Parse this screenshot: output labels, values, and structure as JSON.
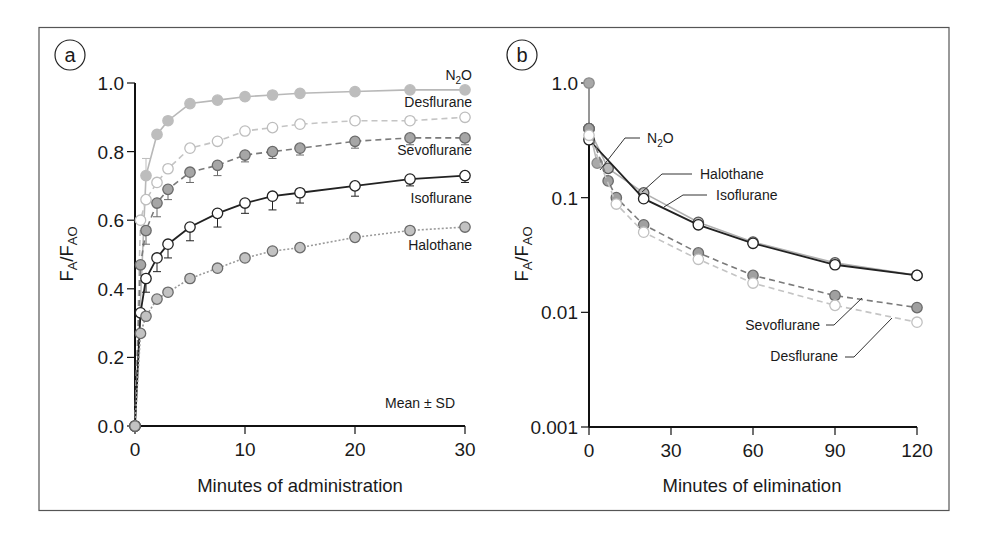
{
  "chart_data": [
    {
      "panel": "a",
      "type": "line",
      "title": "",
      "xlabel": "Minutes of administration",
      "ylabel": "FA/FAO",
      "ylabel_main": "F",
      "ylabel_sub1": "A",
      "ylabel_sub2": "AO",
      "xlim": [
        0,
        30
      ],
      "ylim": [
        0,
        1.0
      ],
      "yscale": "linear",
      "xticks": [
        0,
        10,
        20,
        30
      ],
      "xtick_labels": [
        "0",
        "10",
        "20",
        "30"
      ],
      "yticks": [
        0,
        0.2,
        0.4,
        0.6,
        0.8,
        1.0
      ],
      "ytick_labels": [
        "0.0",
        "0.2",
        "0.4",
        "0.6",
        "0.8",
        "1.0"
      ],
      "grid": false,
      "annotation": "Mean ± SD",
      "series": [
        {
          "name": "N2O",
          "label_main": "N",
          "label_sub": "2",
          "label_tail": "O",
          "style": "solid",
          "line_color": "#b8b8b8",
          "marker": "filled",
          "marker_fill": "#bdbdbd",
          "marker_stroke": "#bdbdbd",
          "x": [
            0,
            1,
            2,
            3,
            5,
            7.5,
            10,
            12.5,
            15,
            20,
            25,
            30
          ],
          "y": [
            0,
            0.73,
            0.85,
            0.89,
            0.94,
            0.95,
            0.96,
            0.965,
            0.97,
            0.975,
            0.98,
            0.98
          ],
          "sd": [
            0,
            0.05,
            0,
            0,
            0,
            0,
            0,
            0,
            0,
            0,
            0,
            0
          ]
        },
        {
          "name": "Desflurane",
          "style": "dashed",
          "line_color": "#c4c4c4",
          "marker": "open",
          "marker_fill": "#ffffff",
          "marker_stroke": "#bdbdbd",
          "x": [
            0,
            0.5,
            1,
            2,
            3,
            5,
            7.5,
            10,
            12.5,
            15,
            20,
            25,
            30
          ],
          "y": [
            0,
            0.6,
            0.66,
            0.71,
            0.75,
            0.81,
            0.83,
            0.86,
            0.87,
            0.88,
            0.89,
            0.89,
            0.9
          ],
          "sd": [
            0,
            0,
            0,
            0,
            0,
            0,
            0,
            0,
            0,
            0,
            0,
            0,
            0
          ]
        },
        {
          "name": "Sevoflurane",
          "style": "dashed",
          "line_color": "#7a7a7a",
          "marker": "filled",
          "marker_fill": "#a6a6a6",
          "marker_stroke": "#6a6a6a",
          "x": [
            0,
            0.5,
            1,
            2,
            3,
            5,
            7.5,
            10,
            12.5,
            15,
            20,
            25,
            30
          ],
          "y": [
            0,
            0.47,
            0.57,
            0.65,
            0.69,
            0.74,
            0.76,
            0.79,
            0.8,
            0.81,
            0.83,
            0.84,
            0.84
          ],
          "sd": [
            0,
            0,
            0.04,
            0.04,
            0.03,
            0.03,
            0.03,
            0.02,
            0.02,
            0.02,
            0.02,
            0.02,
            0.02
          ]
        },
        {
          "name": "Isoflurane",
          "style": "solid",
          "line_color": "#222222",
          "marker": "open",
          "marker_fill": "#ffffff",
          "marker_stroke": "#222222",
          "x": [
            0,
            0.5,
            1,
            2,
            3,
            5,
            7.5,
            10,
            12.5,
            15,
            20,
            25,
            30
          ],
          "y": [
            0,
            0.33,
            0.43,
            0.49,
            0.53,
            0.58,
            0.62,
            0.65,
            0.67,
            0.68,
            0.7,
            0.72,
            0.73
          ],
          "sd": [
            0,
            0,
            0.04,
            0.04,
            0.04,
            0.04,
            0.04,
            0.03,
            0.04,
            0.03,
            0.03,
            0.02,
            0.02
          ]
        },
        {
          "name": "Halothane",
          "style": "dotted",
          "line_color": "#9a9a9a",
          "marker": "filled",
          "marker_fill": "#c2c2c2",
          "marker_stroke": "#6a6a6a",
          "x": [
            0,
            0.5,
            1,
            2,
            3,
            5,
            7.5,
            10,
            12.5,
            15,
            20,
            25,
            30
          ],
          "y": [
            0,
            0.27,
            0.32,
            0.37,
            0.39,
            0.43,
            0.46,
            0.49,
            0.51,
            0.52,
            0.55,
            0.57,
            0.58
          ],
          "sd": [
            0,
            0,
            0,
            0,
            0,
            0.01,
            0.01,
            0.01,
            0.01,
            0.01,
            0.01,
            0.01,
            0.01
          ]
        }
      ]
    },
    {
      "panel": "b",
      "type": "line",
      "title": "",
      "xlabel": "Minutes of elimination",
      "ylabel": "FA/FAO",
      "ylabel_main": "F",
      "ylabel_sub1": "A",
      "ylabel_sub2": "AO",
      "xlim": [
        0,
        120
      ],
      "ylim": [
        0.001,
        1.0
      ],
      "yscale": "log",
      "xticks": [
        0,
        30,
        60,
        90,
        120
      ],
      "xtick_labels": [
        "0",
        "30",
        "60",
        "90",
        "120"
      ],
      "yticks": [
        1.0,
        0.1,
        0.01,
        0.001
      ],
      "ytick_labels": [
        "1.0",
        "0.1",
        "0.01",
        "0.001"
      ],
      "grid": false,
      "series": [
        {
          "name": "N2O",
          "label_main": "N",
          "label_sub": "2",
          "label_tail": "O",
          "style": "solid",
          "line_color": "#b8b8b8",
          "marker": "filled",
          "marker_fill": "#a8a8a8",
          "marker_stroke": "#8a8a8a",
          "x": [
            0,
            0,
            3
          ],
          "y": [
            1.0,
            0.4,
            0.2
          ]
        },
        {
          "name": "Halothane",
          "style": "solid",
          "line_color": "#b0b0b0",
          "marker": "filled",
          "marker_fill": "#b8b8b8",
          "marker_stroke": "#555555",
          "x": [
            0,
            7,
            20,
            40,
            60,
            90,
            120
          ],
          "y": [
            0.4,
            0.18,
            0.11,
            0.061,
            0.041,
            0.027,
            0.021
          ]
        },
        {
          "name": "Isoflurane",
          "style": "solid",
          "line_color": "#222222",
          "marker": "open",
          "marker_fill": "#ffffff",
          "marker_stroke": "#222222",
          "x": [
            0,
            20,
            40,
            60,
            90,
            120
          ],
          "y": [
            0.32,
            0.098,
            0.058,
            0.04,
            0.026,
            0.021
          ]
        },
        {
          "name": "Sevoflurane",
          "style": "dashed",
          "line_color": "#7a7a7a",
          "marker": "filled",
          "marker_fill": "#a0a0a0",
          "marker_stroke": "#6a6a6a",
          "x": [
            0,
            7,
            10,
            20,
            40,
            60,
            90,
            120
          ],
          "y": [
            0.4,
            0.14,
            0.1,
            0.058,
            0.033,
            0.021,
            0.014,
            0.011
          ]
        },
        {
          "name": "Desflurane",
          "style": "dashed",
          "line_color": "#c4c4c4",
          "marker": "open",
          "marker_fill": "#ffffff",
          "marker_stroke": "#c0c0c0",
          "x": [
            0,
            10,
            20,
            40,
            60,
            90,
            120
          ],
          "y": [
            0.35,
            0.088,
            0.05,
            0.029,
            0.018,
            0.0115,
            0.0082
          ]
        }
      ]
    }
  ],
  "panels": {
    "a": {
      "letter": "a"
    },
    "b": {
      "letter": "b"
    }
  },
  "labels_b": {
    "n2o": "N2O",
    "halothane": "Halothane",
    "isoflurane": "Isoflurane",
    "sevoflurane": "Sevoflurane",
    "desflurane": "Desflurane"
  }
}
